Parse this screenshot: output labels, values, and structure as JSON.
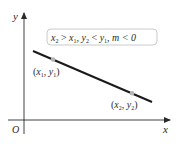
{
  "diagram": {
    "axes": {
      "x_label": "x",
      "y_label": "y",
      "origin_label": "O"
    },
    "condition_box": {
      "x2": "x",
      "x2_sub": "2",
      "gt": " > ",
      "x1": "x",
      "x1_sub": "1",
      "sep1": ", ",
      "y2": "y",
      "y2_sub": "2",
      "lt": " < ",
      "y1": "y",
      "y1_sub": "1",
      "sep2": ", ",
      "m_expr": "m < 0"
    },
    "point1": {
      "open": "(",
      "x": "x",
      "x_sub": "1",
      "comma": ", ",
      "y": "y",
      "y_sub": "1",
      "close": ")"
    },
    "point2": {
      "open": "(",
      "x": "x",
      "x_sub": "2",
      "comma": ", ",
      "y": "y",
      "y_sub": "2",
      "close": ")"
    },
    "colors": {
      "axis": "#2a2a2a",
      "line": "#1a1a1a",
      "point": "#b5b5b5",
      "box_border": "#bdbdbd"
    }
  }
}
